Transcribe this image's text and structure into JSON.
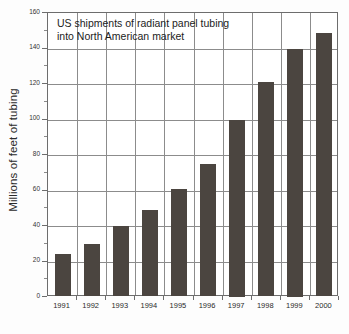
{
  "figure": {
    "name": "bar-chart-figure",
    "background_color": "#fdfdfd"
  },
  "chart_data": {
    "type": "bar",
    "title": "US shipments of radiant panel tubing into North American market",
    "title_line_1": "US shipments of radiant panel tubing",
    "title_line_2": "into North American market",
    "xlabel": "",
    "ylabel": "Millions of feet of tubing",
    "categories": [
      "1991",
      "1992",
      "1993",
      "1994",
      "1995",
      "1996",
      "1997",
      "1998",
      "1999",
      "2000"
    ],
    "values": [
      24,
      30,
      40,
      49,
      61,
      75,
      100,
      121,
      140,
      149
    ],
    "ylim": [
      0,
      160
    ],
    "ytick_values": [
      0,
      20,
      40,
      60,
      80,
      100,
      120,
      140,
      160
    ],
    "ytick_labels": [
      "0",
      "20",
      "40",
      "60",
      "80",
      "100",
      "120",
      "140",
      "160"
    ],
    "grid": "both",
    "legend": "none",
    "bar_color": "#4b4540",
    "grid_color": "#8c8c8c",
    "axis_color": "#6d6d6d"
  }
}
